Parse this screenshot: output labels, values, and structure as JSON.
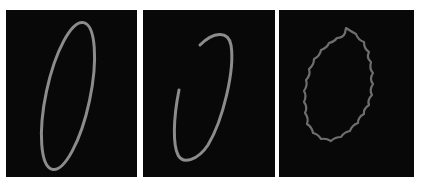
{
  "figure": {
    "panels": [
      {
        "id": "closed-ellipse",
        "shape": "closed ellipse contour",
        "stroke_color": "#8a8a8a"
      },
      {
        "id": "open-arc",
        "shape": "open elliptical arc contour",
        "stroke_color": "#8a8a8a"
      },
      {
        "id": "wavy-ellipse",
        "shape": "wavy ellipse contour",
        "stroke_color": "#6e6e6e"
      }
    ],
    "background_color": "#080808"
  }
}
